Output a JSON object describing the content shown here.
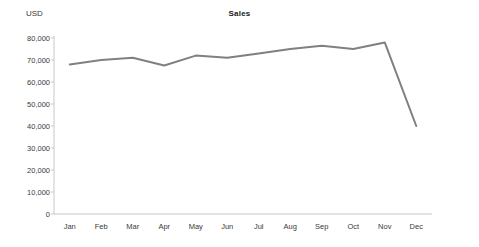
{
  "chart_data": {
    "type": "line",
    "title": "Sales",
    "xlabel": "",
    "ylabel": "USD",
    "categories": [
      "Jan",
      "Feb",
      "Mar",
      "Apr",
      "May",
      "Jun",
      "Jul",
      "Aug",
      "Sep",
      "Oct",
      "Nov",
      "Dec"
    ],
    "values": [
      68000,
      70000,
      71000,
      67500,
      72000,
      71000,
      73000,
      75000,
      76500,
      75000,
      78000,
      40000
    ],
    "series": [
      {
        "name": "Sales",
        "values": [
          68000,
          70000,
          71000,
          67500,
          72000,
          71000,
          73000,
          75000,
          76500,
          75000,
          78000,
          40000
        ],
        "color": "#808080"
      }
    ],
    "ylim": [
      0,
      80000
    ],
    "ytick_values": [
      0,
      10000,
      20000,
      30000,
      40000,
      50000,
      60000,
      70000,
      80000
    ],
    "ytick_labels": [
      "0",
      "10,000",
      "20,000",
      "30,000",
      "40,000",
      "50,000",
      "60,000",
      "70,000",
      "80,000"
    ],
    "grid": false,
    "legend": false,
    "legend_position": "none",
    "axis_color": "#c8c8c8",
    "line_color": "#808080",
    "line_width": 2,
    "text_color": "#3a3a3a"
  }
}
